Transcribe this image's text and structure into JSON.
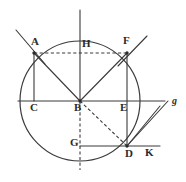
{
  "figure": {
    "type": "geometry-diagram",
    "stroke_color": "#3a3a3a",
    "background": "#ffffff",
    "labels": [
      {
        "id": "A",
        "text": "A",
        "x": 31,
        "y": 36
      },
      {
        "id": "H",
        "text": "H",
        "x": 82,
        "y": 38
      },
      {
        "id": "F",
        "text": "F",
        "x": 123,
        "y": 35
      },
      {
        "id": "C",
        "text": "C",
        "x": 30,
        "y": 102
      },
      {
        "id": "B",
        "text": "B",
        "x": 74,
        "y": 102
      },
      {
        "id": "E",
        "text": "E",
        "x": 120,
        "y": 102
      },
      {
        "id": "g",
        "text": "g",
        "x": 172,
        "y": 96
      },
      {
        "id": "G",
        "text": "G",
        "x": 70,
        "y": 137
      },
      {
        "id": "D",
        "text": "D",
        "x": 125,
        "y": 148
      },
      {
        "id": "K",
        "text": "K",
        "x": 145,
        "y": 147
      }
    ],
    "points": {
      "A": {
        "x": 34,
        "y": 53
      },
      "F": {
        "x": 127,
        "y": 53
      },
      "C": {
        "x": 34,
        "y": 101
      },
      "B": {
        "x": 80,
        "y": 101
      },
      "E": {
        "x": 127,
        "y": 101
      },
      "G": {
        "x": 80,
        "y": 146
      },
      "D": {
        "x": 127,
        "y": 146
      },
      "g": {
        "x": 168,
        "y": 101
      },
      "K": {
        "x": 160,
        "y": 146
      }
    },
    "circle": {
      "cx": 80,
      "cy": 101,
      "r": 60
    },
    "solid_segments": [
      {
        "name": "vertical-axis",
        "x1": 80,
        "y1": 10,
        "x2": 80,
        "y2": 101
      },
      {
        "name": "horizontal-axis",
        "x1": 18,
        "y1": 101,
        "x2": 165,
        "y2": 101
      },
      {
        "name": "chord-A-B",
        "x1": 34,
        "y1": 53,
        "x2": 80,
        "y2": 101
      },
      {
        "name": "chord-B-F",
        "x1": 80,
        "y1": 101,
        "x2": 127,
        "y2": 53
      },
      {
        "name": "segment-A-C",
        "x1": 34,
        "y1": 53,
        "x2": 34,
        "y2": 101
      },
      {
        "name": "segment-F-E-D",
        "x1": 127,
        "y1": 53,
        "x2": 127,
        "y2": 146
      },
      {
        "name": "segment-G-D-K",
        "x1": 80,
        "y1": 146,
        "x2": 160,
        "y2": 146
      },
      {
        "name": "ray-through-A",
        "x1": 16,
        "y1": 30,
        "x2": 45,
        "y2": 64
      },
      {
        "name": "ray-through-F",
        "x1": 147,
        "y1": 36,
        "x2": 118,
        "y2": 66
      },
      {
        "name": "ray-D-to-g",
        "x1": 127,
        "y1": 146,
        "x2": 168,
        "y2": 101
      },
      {
        "name": "ray-D-to-g-second",
        "x1": 127,
        "y1": 146,
        "x2": 160,
        "y2": 106
      }
    ],
    "dashed_segments": [
      {
        "name": "dashed-A-F",
        "x1": 34,
        "y1": 53,
        "x2": 127,
        "y2": 53
      },
      {
        "name": "dashed-B-G",
        "x1": 80,
        "y1": 101,
        "x2": 80,
        "y2": 170
      },
      {
        "name": "dashed-B-D",
        "x1": 80,
        "y1": 101,
        "x2": 127,
        "y2": 146
      }
    ]
  }
}
